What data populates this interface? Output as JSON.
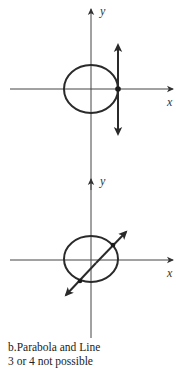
{
  "figure": {
    "graphs": [
      {
        "id": "top",
        "description": "Ellipse with vertical tangent line touching at one point on the x-axis",
        "x_axis_label": "x",
        "y_axis_label": "y",
        "curve": "ellipse",
        "line": "vertical",
        "intersection_points": 1
      },
      {
        "id": "bottom",
        "description": "Ellipse with diagonal line crossing at two points",
        "x_axis_label": "x",
        "y_axis_label": "y",
        "curve": "ellipse",
        "line": "diagonal",
        "intersection_points": 2
      }
    ],
    "colors": {
      "stroke": "#2a2a2a",
      "axis": "#444444",
      "background": "#ffffff"
    }
  },
  "caption": {
    "line1": "b.Parabola and Line",
    "line2": "3 or 4 not possible"
  }
}
